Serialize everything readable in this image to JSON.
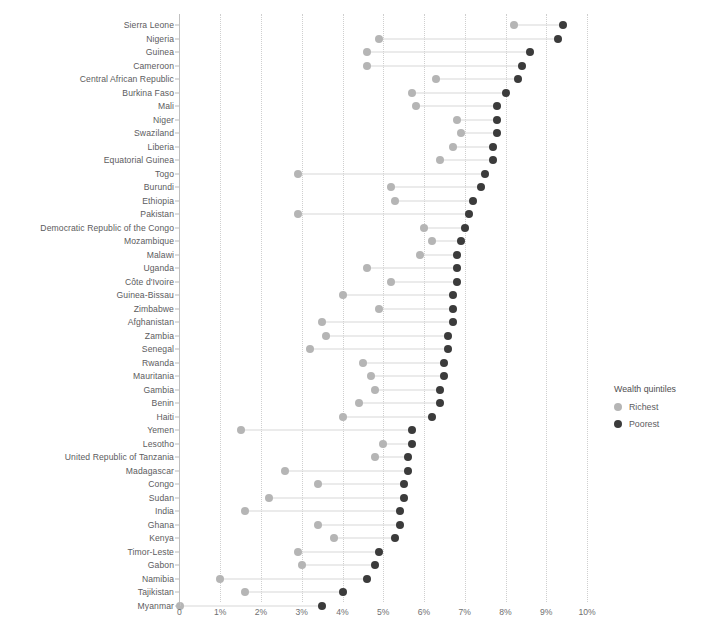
{
  "chart_data": {
    "type": "scatter",
    "subtype": "dumbbell",
    "title": "",
    "xlabel": "",
    "ylabel": "",
    "xlim": [
      0,
      10
    ],
    "xtick_labels": [
      "0",
      "1%",
      "2%",
      "3%",
      "4%",
      "5%",
      "6%",
      "7%",
      "8%",
      "9%",
      "10%"
    ],
    "xticks": [
      0,
      1,
      2,
      3,
      4,
      5,
      6,
      7,
      8,
      9,
      10
    ],
    "grid": "vertical-dotted",
    "legend_position": "right",
    "legend": {
      "title": "Wealth quintiles",
      "entries": [
        {
          "name": "Richest",
          "color": "#b5b5b5"
        },
        {
          "name": "Poorest",
          "color": "#3b3b3b"
        }
      ]
    },
    "series": [
      {
        "name": "Richest",
        "color": "#b5b5b5"
      },
      {
        "name": "Poorest",
        "color": "#3b3b3b"
      }
    ],
    "categories": [
      "Sierra Leone",
      "Nigeria",
      "Guinea",
      "Cameroon",
      "Central African Republic",
      "Burkina Faso",
      "Mali",
      "Niger",
      "Swaziland",
      "Liberia",
      "Equatorial Guinea",
      "Togo",
      "Burundi",
      "Ethiopia",
      "Pakistan",
      "Democratic Republic of the Congo",
      "Mozambique",
      "Malawi",
      "Uganda",
      "Côte d'Ivoire",
      "Guinea-Bissau",
      "Zimbabwe",
      "Afghanistan",
      "Zambia",
      "Senegal",
      "Rwanda",
      "Mauritania",
      "Gambia",
      "Benin",
      "Haiti",
      "Yemen",
      "Lesotho",
      "United Republic of Tanzania",
      "Madagascar",
      "Congo",
      "Sudan",
      "India",
      "Ghana",
      "Kenya",
      "Timor-Leste",
      "Gabon",
      "Namibia",
      "Tajikistan",
      "Myanmar"
    ],
    "rows": [
      {
        "category": "Sierra Leone",
        "richest": 8.2,
        "poorest": 9.4
      },
      {
        "category": "Nigeria",
        "richest": 4.9,
        "poorest": 9.3
      },
      {
        "category": "Guinea",
        "richest": 4.6,
        "poorest": 8.6
      },
      {
        "category": "Cameroon",
        "richest": 4.6,
        "poorest": 8.4
      },
      {
        "category": "Central African Republic",
        "richest": 6.3,
        "poorest": 8.3
      },
      {
        "category": "Burkina Faso",
        "richest": 5.7,
        "poorest": 8.0
      },
      {
        "category": "Mali",
        "richest": 5.8,
        "poorest": 7.8
      },
      {
        "category": "Niger",
        "richest": 6.8,
        "poorest": 7.8
      },
      {
        "category": "Swaziland",
        "richest": 6.9,
        "poorest": 7.8
      },
      {
        "category": "Liberia",
        "richest": 6.7,
        "poorest": 7.7
      },
      {
        "category": "Equatorial Guinea",
        "richest": 6.4,
        "poorest": 7.7
      },
      {
        "category": "Togo",
        "richest": 2.9,
        "poorest": 7.5
      },
      {
        "category": "Burundi",
        "richest": 5.2,
        "poorest": 7.4
      },
      {
        "category": "Ethiopia",
        "richest": 5.3,
        "poorest": 7.2
      },
      {
        "category": "Pakistan",
        "richest": 2.9,
        "poorest": 7.1
      },
      {
        "category": "Democratic Republic of the Congo",
        "richest": 6.0,
        "poorest": 7.0
      },
      {
        "category": "Mozambique",
        "richest": 6.2,
        "poorest": 6.9
      },
      {
        "category": "Malawi",
        "richest": 5.9,
        "poorest": 6.8
      },
      {
        "category": "Uganda",
        "richest": 4.6,
        "poorest": 6.8
      },
      {
        "category": "Côte d'Ivoire",
        "richest": 5.2,
        "poorest": 6.8
      },
      {
        "category": "Guinea-Bissau",
        "richest": 4.0,
        "poorest": 6.7
      },
      {
        "category": "Zimbabwe",
        "richest": 4.9,
        "poorest": 6.7
      },
      {
        "category": "Afghanistan",
        "richest": 3.5,
        "poorest": 6.7
      },
      {
        "category": "Zambia",
        "richest": 3.6,
        "poorest": 6.6
      },
      {
        "category": "Senegal",
        "richest": 3.2,
        "poorest": 6.6
      },
      {
        "category": "Rwanda",
        "richest": 4.5,
        "poorest": 6.5
      },
      {
        "category": "Mauritania",
        "richest": 4.7,
        "poorest": 6.5
      },
      {
        "category": "Gambia",
        "richest": 4.8,
        "poorest": 6.4
      },
      {
        "category": "Benin",
        "richest": 4.4,
        "poorest": 6.4
      },
      {
        "category": "Haiti",
        "richest": 4.0,
        "poorest": 6.2
      },
      {
        "category": "Yemen",
        "richest": 1.5,
        "poorest": 5.7
      },
      {
        "category": "Lesotho",
        "richest": 5.0,
        "poorest": 5.7
      },
      {
        "category": "United Republic of Tanzania",
        "richest": 4.8,
        "poorest": 5.6
      },
      {
        "category": "Madagascar",
        "richest": 2.6,
        "poorest": 5.6
      },
      {
        "category": "Congo",
        "richest": 3.4,
        "poorest": 5.5
      },
      {
        "category": "Sudan",
        "richest": 2.2,
        "poorest": 5.5
      },
      {
        "category": "India",
        "richest": 1.6,
        "poorest": 5.4
      },
      {
        "category": "Ghana",
        "richest": 3.4,
        "poorest": 5.4
      },
      {
        "category": "Kenya",
        "richest": 3.8,
        "poorest": 5.3
      },
      {
        "category": "Timor-Leste",
        "richest": 2.9,
        "poorest": 4.9
      },
      {
        "category": "Gabon",
        "richest": 3.0,
        "poorest": 4.8
      },
      {
        "category": "Namibia",
        "richest": 1.0,
        "poorest": 4.6
      },
      {
        "category": "Tajikistan",
        "richest": 1.6,
        "poorest": 4.0
      },
      {
        "category": "Myanmar",
        "richest": 0.0,
        "poorest": 3.5
      }
    ]
  }
}
